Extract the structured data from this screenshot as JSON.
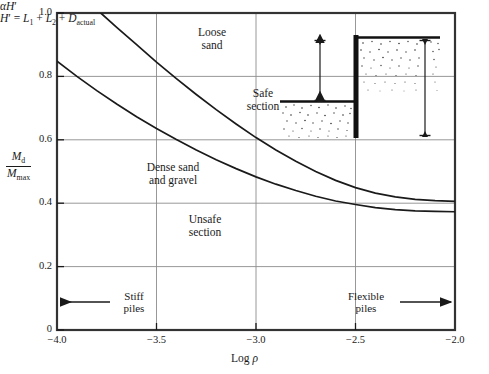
{
  "chart_data": {
    "type": "line",
    "title": "",
    "xlabel": "Log ρ",
    "ylabel": "Md / Mmax",
    "xlim": [
      -4.0,
      -2.0
    ],
    "ylim": [
      0,
      1.0
    ],
    "xticks": [
      "-4.0",
      "-3.5",
      "-3.0",
      "-2.5",
      "-2.0"
    ],
    "yticks": [
      "0",
      "0.2",
      "0.4",
      "0.6",
      "0.8",
      "1.0"
    ],
    "grid": true,
    "legend": "none",
    "series": [
      {
        "name": "Loose sand",
        "x": [
          -3.78,
          -3.7,
          -3.6,
          -3.5,
          -3.4,
          -3.3,
          -3.2,
          -3.1,
          -3.0,
          -2.9,
          -2.8,
          -2.7,
          -2.6,
          -2.5,
          -2.4,
          -2.3,
          -2.2,
          -2.1,
          -2.0
        ],
        "y": [
          1.0,
          0.955,
          0.9,
          0.845,
          0.793,
          0.743,
          0.695,
          0.65,
          0.607,
          0.568,
          0.532,
          0.5,
          0.472,
          0.449,
          0.432,
          0.42,
          0.412,
          0.408,
          0.406
        ]
      },
      {
        "name": "Dense sand and gravel",
        "x": [
          -4.0,
          -3.9,
          -3.8,
          -3.7,
          -3.6,
          -3.5,
          -3.4,
          -3.3,
          -3.2,
          -3.1,
          -3.0,
          -2.9,
          -2.8,
          -2.7,
          -2.6,
          -2.5,
          -2.4,
          -2.3,
          -2.2,
          -2.1,
          -2.0
        ],
        "y": [
          0.848,
          0.8,
          0.755,
          0.713,
          0.673,
          0.636,
          0.601,
          0.568,
          0.537,
          0.509,
          0.483,
          0.46,
          0.44,
          0.422,
          0.407,
          0.396,
          0.386,
          0.38,
          0.376,
          0.374,
          0.373
        ]
      }
    ],
    "annotations": [
      {
        "name": "loose-sand-label",
        "text_line1": "Loose",
        "text_line2": "sand"
      },
      {
        "name": "dense-sand-label",
        "text_line1": "Dense sand",
        "text_line2": "and gravel"
      },
      {
        "name": "safe-section-label",
        "text_line1": "Safe",
        "text_line2": "section"
      },
      {
        "name": "unsafe-section-label",
        "text_line1": "Unsafe",
        "text_line2": "section"
      },
      {
        "name": "stiff-piles-label",
        "text_line1": "Stiff",
        "text_line2": "piles"
      },
      {
        "name": "flexible-piles-label",
        "text_line1": "Flexible",
        "text_line2": "piles"
      }
    ]
  },
  "axes": {
    "x_title_prefix": "Log ",
    "x_title_symbol": "ρ",
    "y_numerator_M": "M",
    "y_numerator_sub": "d",
    "y_denominator_M": "M",
    "y_denominator_sub": "max",
    "x_ticks": [
      "−4.0",
      "−3.5",
      "−3.0",
      "−2.5",
      "−2.0"
    ],
    "y_ticks": [
      "1.0",
      "0.8",
      "0.6",
      "0.4",
      "0.2",
      "0"
    ]
  },
  "curve_labels": {
    "loose_sand_l1": "Loose",
    "loose_sand_l2": "sand",
    "dense_sand_l1": "Dense sand",
    "dense_sand_l2": "and gravel"
  },
  "regions": {
    "safe_l1": "Safe",
    "safe_l2": "section",
    "unsafe_l1": "Unsafe",
    "unsafe_l2": "section"
  },
  "pile_markers": {
    "stiff_l1": "Stiff",
    "stiff_l2": "piles",
    "flexible_l1": "Flexible",
    "flexible_l2": "piles"
  },
  "inset": {
    "alpha_symbol": "α",
    "alpha_H_var": "H",
    "alpha_H_prime": "′",
    "equation_H": "H",
    "equation_prime": "′",
    "equation_eq": " = ",
    "equation_L1_var": "L",
    "equation_L1_sub": "1",
    "equation_plus1": " + ",
    "equation_L2_var": "L",
    "equation_L2_sub": "2",
    "equation_plus2": " + ",
    "equation_D_var": "D",
    "equation_D_sub": "actual"
  },
  "colors": {
    "frame": "#333333",
    "grid": "#8c8c8c",
    "curve": "#1a1a1a",
    "text": "#1a1a1a",
    "wall": "#111111"
  }
}
